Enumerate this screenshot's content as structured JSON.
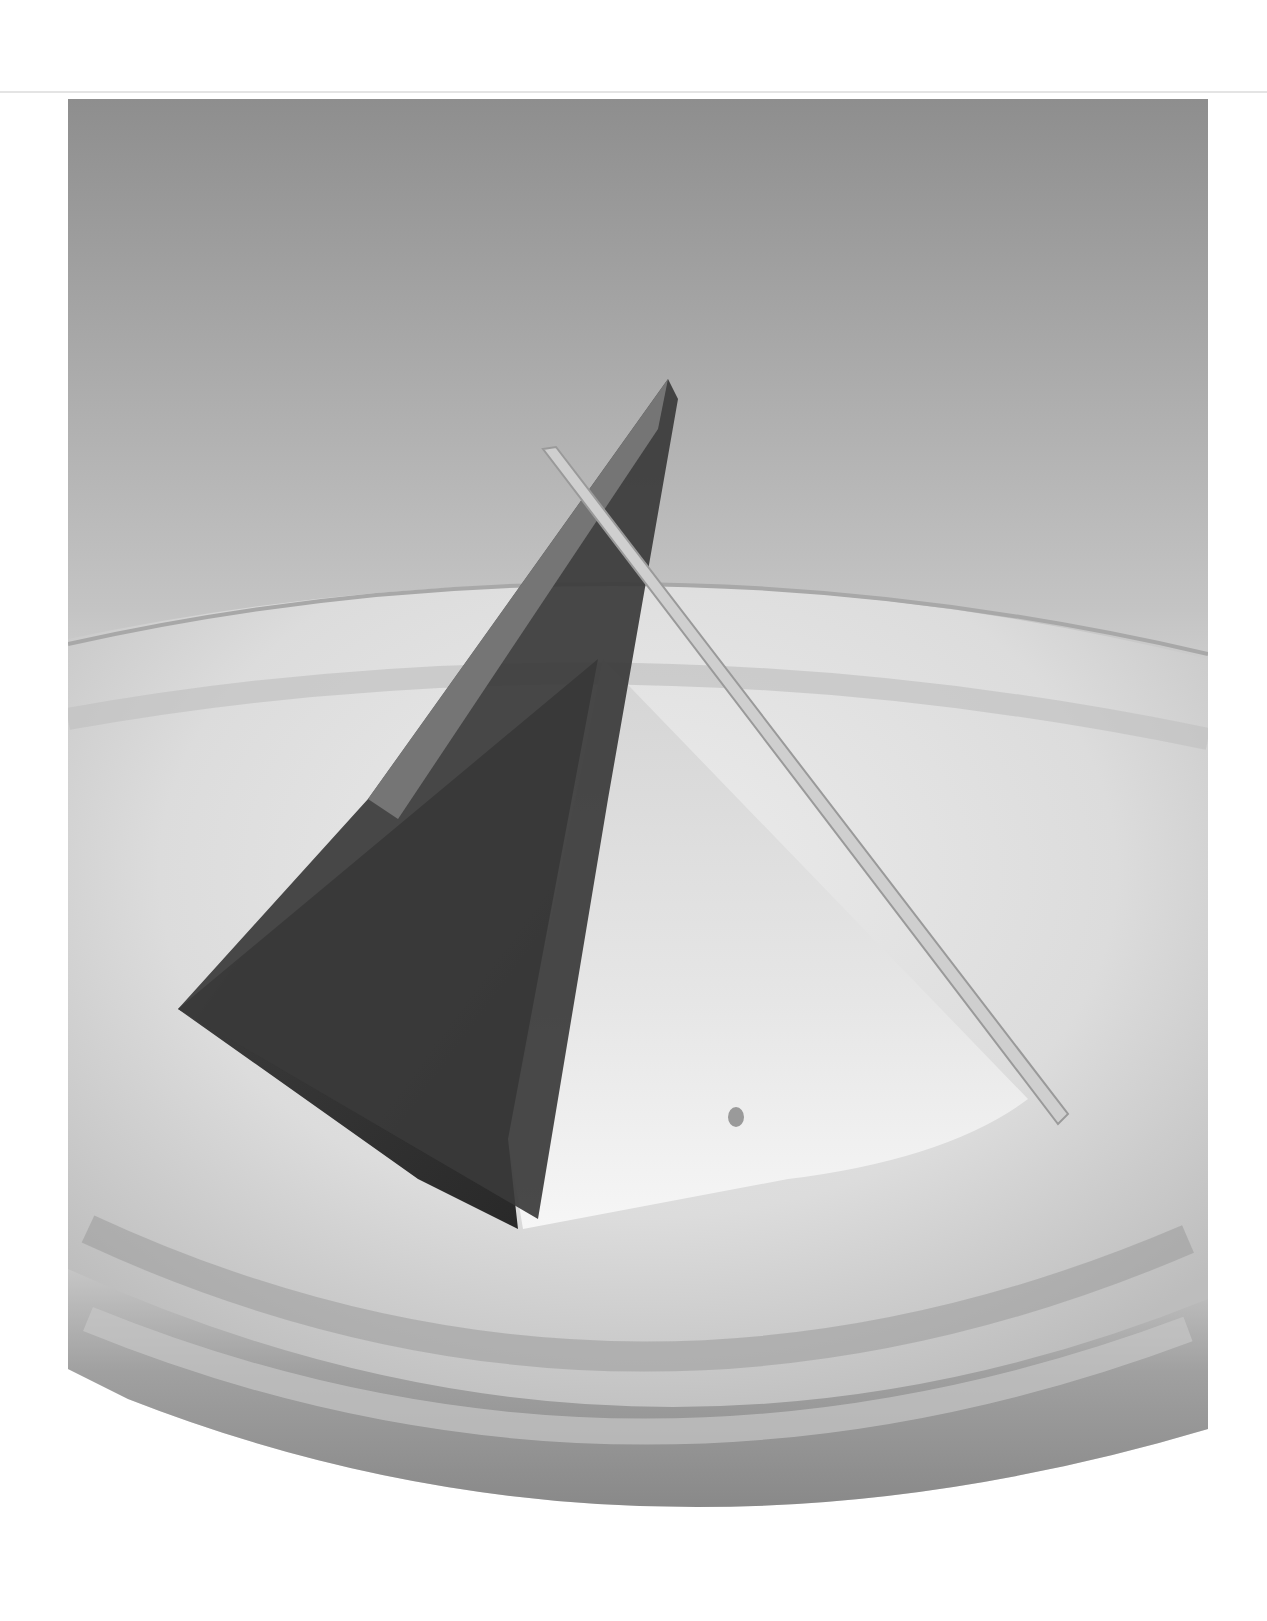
{
  "page": {
    "background": "#ffffff",
    "rule_color": "#e4e4e4"
  },
  "photo": {
    "subject": "pyramid dessert on glass plate",
    "style": "grayscale",
    "colors": {
      "backdrop_top": "#8c8c8c",
      "backdrop_bottom": "#e6e6e6",
      "plate_light": "#e2e2e2",
      "plate_shadow": "#8a8a8a",
      "pyramid_dark": "#2e2e2e",
      "pyramid_light": "#f2f2f2",
      "wafer": "#c8c8c8"
    }
  }
}
